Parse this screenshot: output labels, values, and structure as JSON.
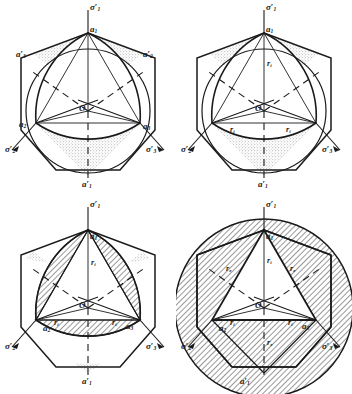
{
  "figure": {
    "kind": "four-panel line diagram",
    "panel_count": 4
  },
  "labels": {
    "sigma1": "σ",
    "sigma1_prime": "′",
    "sigma1_sub": "1",
    "sigma2_sub": "2",
    "sigma3_sub": "3",
    "a_letter": "a",
    "prime": "′",
    "a1_sub": "1",
    "a2_sub": "2",
    "a3_sub": "3",
    "origin": "O",
    "r_letter": "r",
    "r_inner_sub": "i",
    "r_outer_sub": "e"
  },
  "panels": [
    {
      "id": "panel-top-left",
      "name": "hexagon-circle-curved-triangle-stippled",
      "shading": "stippled",
      "axes": [
        {
          "name": "axis-sigma1",
          "text": "σ′",
          "sub": "1",
          "pos": "top"
        },
        {
          "name": "axis-sigma2",
          "text": "σ′",
          "sub": "2",
          "pos": "lower-left"
        },
        {
          "name": "axis-sigma3",
          "text": "σ′",
          "sub": "3",
          "pos": "lower-right"
        }
      ],
      "vertex_labels": [
        {
          "name": "vertex-a1",
          "text": "a",
          "sub": "1",
          "prime": false
        },
        {
          "name": "vertex-a2",
          "text": "a",
          "sub": "2",
          "prime": false
        },
        {
          "name": "vertex-a3",
          "text": "a",
          "sub": "3",
          "prime": false
        },
        {
          "name": "vertex-a1-prime",
          "text": "a",
          "sub": "1",
          "prime": true
        },
        {
          "name": "vertex-a2-prime",
          "text": "a",
          "sub": "2",
          "prime": true
        },
        {
          "name": "vertex-a3-prime",
          "text": "a",
          "sub": "3",
          "prime": true
        }
      ],
      "origin_label": "O",
      "radius_labels": []
    },
    {
      "id": "panel-top-right",
      "name": "hexagon-circle-curved-triangle-inner-radius",
      "shading": "stippled",
      "axes": [
        {
          "name": "axis-sigma1",
          "text": "σ′",
          "sub": "1",
          "pos": "top"
        },
        {
          "name": "axis-sigma2",
          "text": "σ′",
          "sub": "2",
          "pos": "lower-left"
        },
        {
          "name": "axis-sigma3",
          "text": "σ′",
          "sub": "3",
          "pos": "lower-right"
        }
      ],
      "vertex_labels": [
        {
          "name": "vertex-a1",
          "text": "a",
          "sub": "1",
          "prime": false
        },
        {
          "name": "vertex-a1-prime",
          "text": "a",
          "sub": "1",
          "prime": true
        }
      ],
      "origin_label": "O",
      "radius_labels": [
        {
          "name": "radius-ri-top",
          "text": "r",
          "sub": "i"
        },
        {
          "name": "radius-ri-left",
          "text": "r",
          "sub": "i"
        },
        {
          "name": "radius-ri-right",
          "text": "r",
          "sub": "i"
        }
      ]
    },
    {
      "id": "panel-bottom-left",
      "name": "hexagon-curved-triangle-hatched-crescents",
      "shading": "hatched",
      "axes": [
        {
          "name": "axis-sigma1",
          "text": "σ′",
          "sub": "1",
          "pos": "top"
        },
        {
          "name": "axis-sigma2",
          "text": "σ′",
          "sub": "2",
          "pos": "lower-left"
        },
        {
          "name": "axis-sigma3",
          "text": "σ′",
          "sub": "3",
          "pos": "lower-right"
        }
      ],
      "vertex_labels": [
        {
          "name": "vertex-a1",
          "text": "a",
          "sub": "1",
          "prime": false
        },
        {
          "name": "vertex-a2",
          "text": "a",
          "sub": "2",
          "prime": false
        },
        {
          "name": "vertex-a3",
          "text": "a",
          "sub": "3",
          "prime": false
        },
        {
          "name": "vertex-a1-prime",
          "text": "a",
          "sub": "1",
          "prime": true
        }
      ],
      "origin_label": "O",
      "radius_labels": [
        {
          "name": "radius-ri-top",
          "text": "r",
          "sub": "i"
        },
        {
          "name": "radius-ri-left",
          "text": "r",
          "sub": "i"
        },
        {
          "name": "radius-ri-right",
          "text": "r",
          "sub": "i"
        }
      ]
    },
    {
      "id": "panel-bottom-right",
      "name": "hexagon-circumscribed-circle-hatched-annulus",
      "shading": "hatched",
      "axes": [
        {
          "name": "axis-sigma1",
          "text": "σ′",
          "sub": "1",
          "pos": "top"
        },
        {
          "name": "axis-sigma2",
          "text": "σ′",
          "sub": "2",
          "pos": "lower-left"
        },
        {
          "name": "axis-sigma3",
          "text": "σ′",
          "sub": "3",
          "pos": "lower-right"
        }
      ],
      "vertex_labels": [
        {
          "name": "vertex-a1",
          "text": "a",
          "sub": "1",
          "prime": false
        },
        {
          "name": "vertex-a2",
          "text": "a",
          "sub": "2",
          "prime": false
        },
        {
          "name": "vertex-a3",
          "text": "a",
          "sub": "3",
          "prime": false
        },
        {
          "name": "vertex-a1-prime",
          "text": "a",
          "sub": "1",
          "prime": true
        }
      ],
      "origin_label": "O",
      "radius_labels": [
        {
          "name": "radius-ri-top",
          "text": "r",
          "sub": "i"
        },
        {
          "name": "radius-ri-left",
          "text": "r",
          "sub": "i"
        },
        {
          "name": "radius-ri-right",
          "text": "r",
          "sub": "i"
        },
        {
          "name": "radius-re-upper-left",
          "text": "r",
          "sub": "e"
        },
        {
          "name": "radius-re-upper-right",
          "text": "r",
          "sub": "e"
        },
        {
          "name": "radius-re-bottom",
          "text": "r",
          "sub": "e"
        }
      ]
    }
  ],
  "colors": {
    "ink": "#1a1a1a",
    "paper": "#ffffff",
    "stipple": "#7a7a7a",
    "hatch": "#1a1a1a"
  }
}
